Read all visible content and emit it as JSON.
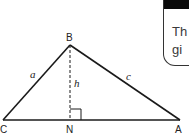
{
  "diagram": {
    "type": "triangle",
    "vertices": {
      "B": {
        "label": "B"
      },
      "C": {
        "label": "C"
      },
      "A": {
        "label": "A"
      },
      "N": {
        "label": "N"
      }
    },
    "sides": {
      "a": "a",
      "c": "c",
      "h": "h"
    },
    "right_angle_at": "N",
    "altitude": "BN"
  },
  "card": {
    "line1": "Th",
    "line2": "gi"
  },
  "colors": {
    "stroke": "#1a1a1a",
    "card_header": "#0a0a0a",
    "card_text": "#3a3a3a"
  }
}
